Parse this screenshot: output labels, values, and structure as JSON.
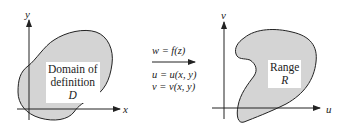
{
  "left_plane": {
    "x_axis_label": "x",
    "y_axis_label": "y",
    "region_label_line1": "Domain of",
    "region_label_line2": "definition",
    "region_symbol": "D"
  },
  "mapping": {
    "function": "w = f(z)",
    "u_eq": "u = u(x, y)",
    "v_eq": "v = v(x, y)"
  },
  "right_plane": {
    "u_axis_label": "u",
    "v_axis_label": "v",
    "region_label": "Range",
    "region_symbol": "R"
  },
  "colors": {
    "region_fill": "#d4d4d4",
    "stroke": "#222222"
  }
}
